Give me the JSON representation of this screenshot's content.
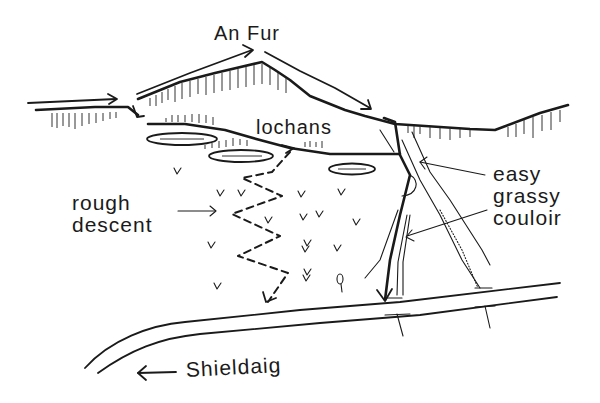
{
  "diagram": {
    "type": "hand-drawn route sketch map",
    "labels": {
      "summit": "An Fur",
      "lochans": "lochans",
      "rough_descent_line1": "rough",
      "rough_descent_line2": "descent",
      "couloir_line1": "easy",
      "couloir_line2": "grassy",
      "couloir_line3": "couloir",
      "town": "Shieldaig"
    },
    "colors": {
      "ink": "#1a1a1a",
      "paper": "#ffffff"
    },
    "features": [
      "ridge-line",
      "route-arrows",
      "lochans",
      "zigzag-descent",
      "couloir",
      "road",
      "streams"
    ]
  }
}
